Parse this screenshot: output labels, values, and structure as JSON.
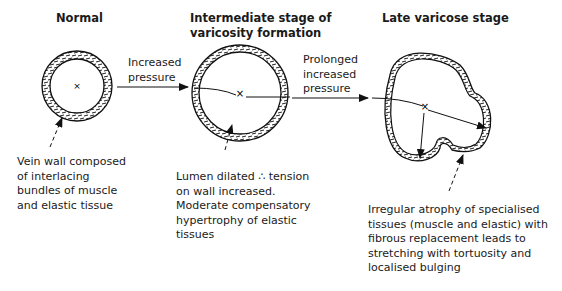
{
  "stages": [
    {
      "title": "Normal",
      "description": "Vein wall composed\nof interlacing\nbundles of muscle\nand elastic tissue"
    },
    {
      "title": "Intermediate stage of\nvaricosity formation",
      "description": "Lumen dilated ∴ tension\non wall increased.\nModerate compensatory\nhypertrophy of elastic\ntissues"
    },
    {
      "title": "Late varicose stage",
      "description": "Irregular atrophy of specialised\ntissues (muscle and elastic) with\nfibrous replacement leads to\nstretching with tortuosity and\nlocalised bulging"
    }
  ],
  "transitions": [
    {
      "label": "Increased\npressure"
    },
    {
      "label": "Prolonged\nincreased\npressure"
    }
  ],
  "center_marker": "×"
}
